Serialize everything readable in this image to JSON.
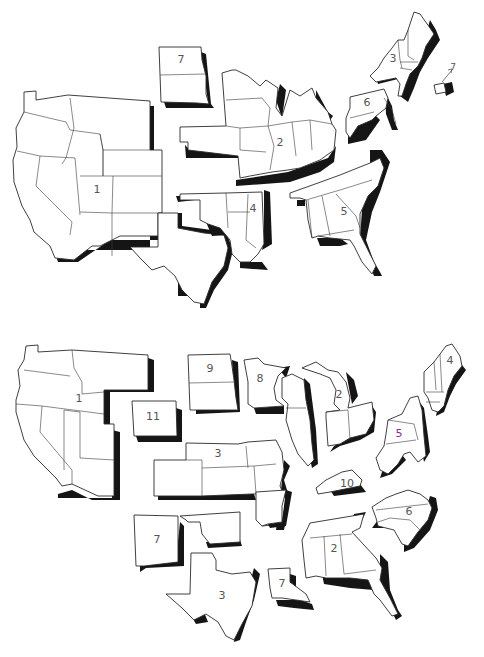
{
  "maps": [
    {
      "name": "top-map",
      "description": "Contiguous United States split into 7 numbered regional groupings",
      "regions": [
        {
          "id": "r1-west",
          "label": "1",
          "label_pos": [
            97,
            190
          ],
          "states": [
            "WA",
            "OR",
            "CA",
            "ID",
            "NV",
            "MT",
            "WY",
            "UT",
            "CO",
            "AZ",
            "NM"
          ]
        },
        {
          "id": "r1-texas",
          "label": "",
          "label_pos": [
            0,
            0
          ],
          "states": [
            "TX"
          ]
        },
        {
          "id": "r7-dakotas",
          "label": "7",
          "label_pos": [
            181,
            60
          ],
          "states": [
            "ND",
            "SD"
          ]
        },
        {
          "id": "r2-midwest",
          "label": "2",
          "label_pos": [
            280,
            143
          ],
          "states": [
            "MN",
            "WI",
            "IA",
            "IL",
            "MI",
            "IN",
            "OH",
            "MO",
            "NE",
            "KS"
          ]
        },
        {
          "id": "r4-south-central",
          "label": "4",
          "label_pos": [
            253,
            209
          ],
          "states": [
            "OK",
            "AR",
            "LA",
            "MS"
          ]
        },
        {
          "id": "r5-southeast",
          "label": "5",
          "label_pos": [
            344,
            212
          ],
          "states": [
            "AL",
            "GA",
            "SC",
            "FL",
            "TN",
            "NC",
            "KY",
            "VA"
          ]
        },
        {
          "id": "r6-mid-atlantic",
          "label": "6",
          "label_pos": [
            367,
            103
          ],
          "states": [
            "PA",
            "NJ",
            "MD",
            "DE",
            "WV"
          ]
        },
        {
          "id": "r3-new-england",
          "label": "3",
          "label_pos": [
            393,
            59
          ],
          "states": [
            "NY",
            "VT",
            "NH",
            "ME",
            "MA",
            "CT"
          ]
        },
        {
          "id": "r7-ri",
          "label": "7",
          "label_pos": [
            451,
            71
          ],
          "states": [
            "RI"
          ],
          "note": "arrow pointing to detached state"
        }
      ]
    },
    {
      "name": "bottom-map",
      "description": "Contiguous United States split into 11 numbered regional groupings",
      "regions": [
        {
          "id": "b1-west",
          "label": "1",
          "label_pos": [
            79,
            399
          ],
          "states": [
            "WA",
            "OR",
            "CA",
            "ID",
            "MT",
            "NV",
            "UT",
            "AZ"
          ]
        },
        {
          "id": "b11-wyoming",
          "label": "11",
          "label_pos": [
            153,
            417
          ],
          "states": [
            "WY"
          ]
        },
        {
          "id": "b9-dakotas",
          "label": "9",
          "label_pos": [
            210,
            369
          ],
          "states": [
            "ND",
            "SD"
          ]
        },
        {
          "id": "b8-minnesota",
          "label": "8",
          "label_pos": [
            260,
            379
          ],
          "states": [
            "MN"
          ]
        },
        {
          "id": "b3-plains",
          "label": "3",
          "label_pos": [
            218,
            454
          ],
          "states": [
            "CO",
            "NE",
            "KS",
            "IA",
            "MO"
          ]
        },
        {
          "id": "b-wisconsin-illinois",
          "label": "",
          "label_pos": [
            0,
            0
          ],
          "states": [
            "WI",
            "IL"
          ]
        },
        {
          "id": "b2-great-lakes",
          "label": "2",
          "label_pos": [
            339,
            395
          ],
          "states": [
            "MI",
            "IN",
            "OH"
          ]
        },
        {
          "id": "b4-new-england",
          "label": "4",
          "label_pos": [
            450,
            361
          ],
          "states": [
            "ME",
            "NH",
            "VT",
            "MA",
            "CT",
            "RI"
          ]
        },
        {
          "id": "b5-mid-atlantic",
          "label": "5",
          "label_pos": [
            399,
            434
          ],
          "label_color": "#8a2a9a",
          "states": [
            "NY",
            "PA",
            "NJ",
            "MD",
            "DE",
            "WV"
          ]
        },
        {
          "id": "b10-kentucky",
          "label": "10",
          "label_pos": [
            347,
            484
          ],
          "states": [
            "KY"
          ]
        },
        {
          "id": "b7-sw",
          "label": "7",
          "label_pos": [
            157,
            540
          ],
          "states": [
            "NM",
            "OK"
          ]
        },
        {
          "id": "b-arkansas",
          "label": "",
          "label_pos": [
            0,
            0
          ],
          "states": [
            "AR"
          ]
        },
        {
          "id": "b6-carolinas",
          "label": "6",
          "label_pos": [
            409,
            512
          ],
          "states": [
            "VA",
            "NC",
            "SC"
          ]
        },
        {
          "id": "b3-texas",
          "label": "3",
          "label_pos": [
            222,
            596
          ],
          "states": [
            "TX"
          ]
        },
        {
          "id": "b7-louisiana",
          "label": "7",
          "label_pos": [
            282,
            584
          ],
          "states": [
            "LA"
          ]
        },
        {
          "id": "b2-southeast",
          "label": "2",
          "label_pos": [
            334,
            549
          ],
          "states": [
            "TN",
            "MS",
            "AL",
            "GA",
            "FL"
          ]
        }
      ]
    }
  ],
  "colors": {
    "background": "#ffffff",
    "outline": "#2a2a2a",
    "shadow": "#151515",
    "label": "#555555",
    "highlight_label": "#8a2a9a"
  }
}
